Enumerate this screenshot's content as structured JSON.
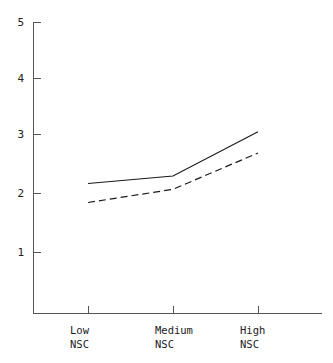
{
  "chart_data": {
    "type": "line",
    "title": "",
    "subtitle": "",
    "xlabel": "",
    "ylabel": "",
    "categories": [
      "Low\nNSC",
      "Medium\nNSC",
      "High\nNSC"
    ],
    "category_lines": [
      {
        "line1": "Low",
        "line2": "NSC"
      },
      {
        "line1": "Medium",
        "line2": "NSC"
      },
      {
        "line1": "High",
        "line2": "NSC"
      }
    ],
    "x": [
      1,
      2,
      3
    ],
    "ylim": [
      0,
      5
    ],
    "xlim": [
      0.5,
      3.5
    ],
    "yticks": [
      1,
      2,
      3,
      4,
      5
    ],
    "ytick_labels": [
      "1",
      "2",
      "3",
      "4",
      "5"
    ],
    "grid": false,
    "legend": "none",
    "series": [
      {
        "name": "solid-line",
        "style": "solid",
        "color": "#1a1a1a",
        "values": [
          2.2,
          2.33,
          3.1
        ]
      },
      {
        "name": "dashed-line",
        "style": "dashed",
        "color": "#1a1a1a",
        "values": [
          1.87,
          2.1,
          2.73
        ]
      }
    ]
  },
  "axes": {
    "y_tick_0": "1",
    "y_tick_1": "2",
    "y_tick_2": "3",
    "y_tick_3": "4",
    "y_tick_4": "5"
  },
  "colors": {
    "axis": "#555555",
    "line": "#1a1a1a",
    "background": "#ffffff"
  }
}
